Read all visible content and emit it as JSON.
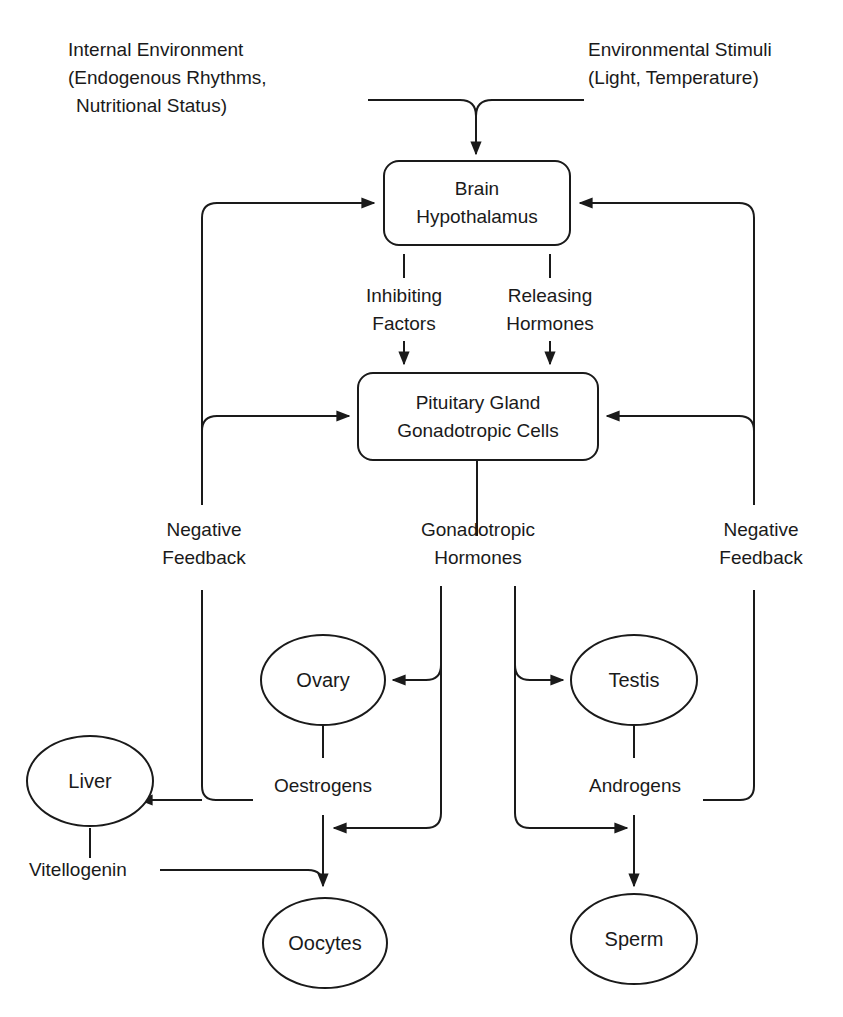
{
  "inputs": {
    "internal": {
      "line1": "Internal Environment",
      "line2": "(Endogenous Rhythms,",
      "line3": "Nutritional Status)"
    },
    "external": {
      "line1": "Environmental Stimuli",
      "line2": "(Light, Temperature)"
    }
  },
  "nodes": {
    "brain": {
      "line1": "Brain",
      "line2": "Hypothalamus"
    },
    "pituitary": {
      "line1": "Pituitary Gland",
      "line2": "Gonadotropic Cells"
    },
    "ovary": "Ovary",
    "testis": "Testis",
    "liver": "Liver",
    "oocytes": "Oocytes",
    "sperm": "Sperm"
  },
  "signals": {
    "inhibiting": {
      "line1": "Inhibiting",
      "line2": "Factors"
    },
    "releasing": {
      "line1": "Releasing",
      "line2": "Hormones"
    },
    "gonadotropic": {
      "line1": "Gonadotropic",
      "line2": "Hormones"
    },
    "oestrogens": "Oestrogens",
    "androgens": "Androgens",
    "vitellogenin": "Vitellogenin"
  },
  "feedback": {
    "left": {
      "line1": "Negative",
      "line2": "Feedback"
    },
    "right": {
      "line1": "Negative",
      "line2": "Feedback"
    }
  },
  "colors": {
    "ink": "#1a1a1a",
    "background": "#ffffff"
  }
}
